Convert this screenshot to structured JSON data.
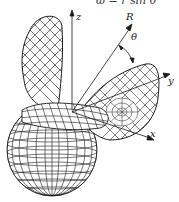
{
  "figure": {
    "equation": "ω = r sin θ",
    "labels": {
      "z": "z",
      "R": "R",
      "theta": "θ",
      "y": "y",
      "x": "x"
    },
    "colors": {
      "line": "#1a1a1a",
      "background": "#ffffff"
    }
  }
}
